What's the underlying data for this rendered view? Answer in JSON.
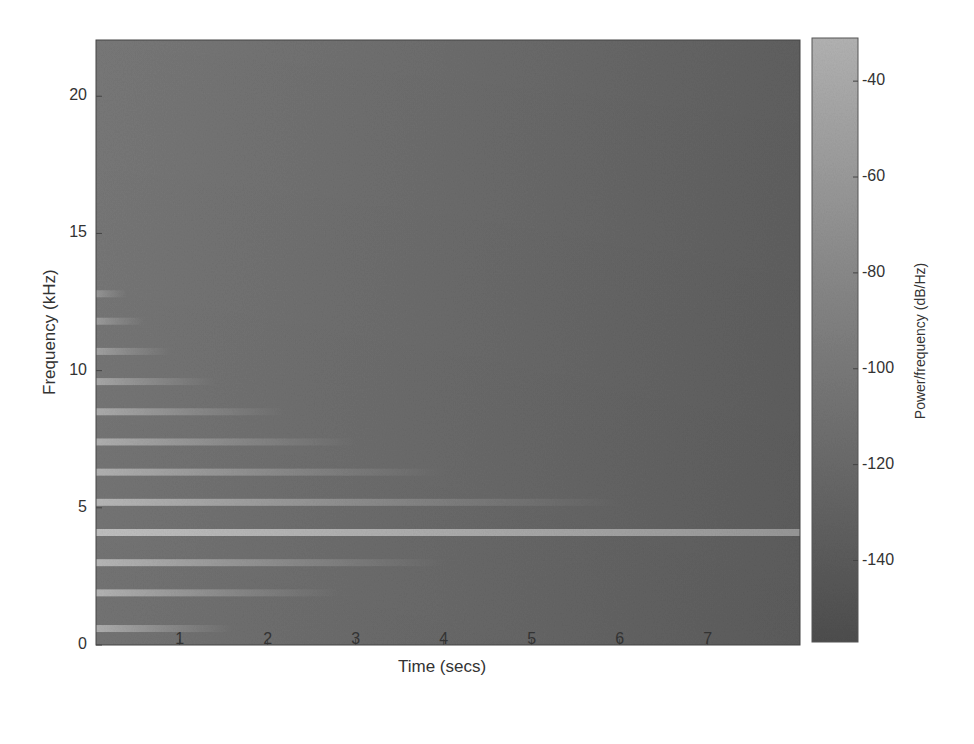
{
  "chart_data": {
    "type": "heatmap",
    "subtype": "spectrogram",
    "title": "",
    "xlabel": "Time (secs)",
    "ylabel": "Frequency (kHz)",
    "colorbar_label": "Power/frequency (dB/Hz)",
    "xlim": [
      0.05,
      8.05
    ],
    "ylim": [
      0,
      22.05
    ],
    "x_ticks": [
      1,
      2,
      3,
      4,
      5,
      6,
      7
    ],
    "y_ticks": [
      0,
      5,
      10,
      15,
      20
    ],
    "colorbar_ticks": [
      -40,
      -60,
      -80,
      -100,
      -120,
      -140
    ],
    "colorbar_range": [
      -157,
      -31
    ],
    "colormap": "grayscale (dark = low power, light = high power)",
    "grid": false,
    "background_level_db": -125,
    "harmonic_bands": [
      {
        "freq_khz": 0.6,
        "peak_db": -70,
        "fade_end_s": 1.6
      },
      {
        "freq_khz": 1.9,
        "peak_db": -65,
        "fade_end_s": 2.8
      },
      {
        "freq_khz": 3.0,
        "peak_db": -62,
        "fade_end_s": 4.0
      },
      {
        "freq_khz": 4.1,
        "peak_db": -55,
        "fade_end_s": 8.05
      },
      {
        "freq_khz": 5.2,
        "peak_db": -62,
        "fade_end_s": 6.0
      },
      {
        "freq_khz": 6.3,
        "peak_db": -68,
        "fade_end_s": 4.0
      },
      {
        "freq_khz": 7.4,
        "peak_db": -70,
        "fade_end_s": 3.0
      },
      {
        "freq_khz": 8.5,
        "peak_db": -74,
        "fade_end_s": 2.2
      },
      {
        "freq_khz": 9.6,
        "peak_db": -78,
        "fade_end_s": 1.4
      },
      {
        "freq_khz": 10.7,
        "peak_db": -84,
        "fade_end_s": 0.9
      },
      {
        "freq_khz": 11.8,
        "peak_db": -90,
        "fade_end_s": 0.6
      },
      {
        "freq_khz": 12.8,
        "peak_db": -95,
        "fade_end_s": 0.4
      }
    ]
  },
  "axes": {
    "x_title": "Time (secs)",
    "y_title": "Frequency (kHz)",
    "colorbar_title": "Power/frequency (dB/Hz)",
    "x_tick_labels": [
      "1",
      "2",
      "3",
      "4",
      "5",
      "6",
      "7"
    ],
    "y_tick_labels": [
      "0",
      "5",
      "10",
      "15",
      "20"
    ],
    "colorbar_tick_labels": [
      "-40",
      "-60",
      "-80",
      "-100",
      "-120",
      "-140"
    ]
  }
}
